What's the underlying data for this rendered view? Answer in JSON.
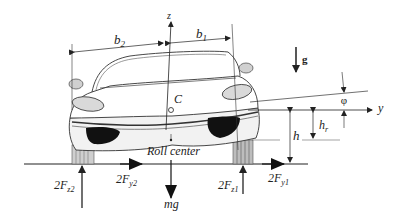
{
  "diagram": {
    "type": "vehicle roll model (front view)",
    "labels": {
      "z_axis": "z",
      "y_axis": "y",
      "b1": "b",
      "b1_sub": "1",
      "b2": "b",
      "b2_sub": "2",
      "gravity": "g",
      "phi": "φ",
      "center_of_mass": "C",
      "h": "h",
      "hr": "h",
      "hr_sub": "r",
      "roll_center": "Roll center",
      "fz2": "2F",
      "fz2_sub": "z2",
      "fy2": "2F",
      "fy2_sub": "y2",
      "mg": "mg",
      "fz1": "2F",
      "fz1_sub": "z1",
      "fy1": "2F",
      "fy1_sub": "y1"
    },
    "colors": {
      "line": "#222222",
      "body_fill": "#f2f2f2",
      "light_fill": "#d9d9d9",
      "dark_fill": "#111111",
      "background": "#ffffff"
    }
  }
}
